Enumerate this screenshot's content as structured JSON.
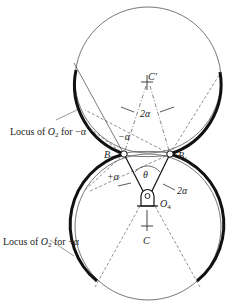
{
  "diagram": {
    "labels": {
      "locus_minus": {
        "pre": "Locus of ",
        "var": "O",
        "sub": "2",
        "post": "  for −α"
      },
      "locus_plus": {
        "pre": "Locus of ",
        "var": "O",
        "sub": "2",
        "post": " for +α"
      },
      "c_prime": "C′",
      "c": "C",
      "b1": {
        "var": "B",
        "sub": "1"
      },
      "b2": {
        "var": "B",
        "sub": "2"
      },
      "o4": {
        "var": "O",
        "sub": "4"
      },
      "two_alpha_top": "2α",
      "two_alpha_right": "2α",
      "minus_alpha": "−α",
      "plus_alpha": "+α",
      "theta": "θ"
    },
    "colors": {
      "line": "#111111",
      "thin": "#555555",
      "background": "#ffffff"
    }
  }
}
